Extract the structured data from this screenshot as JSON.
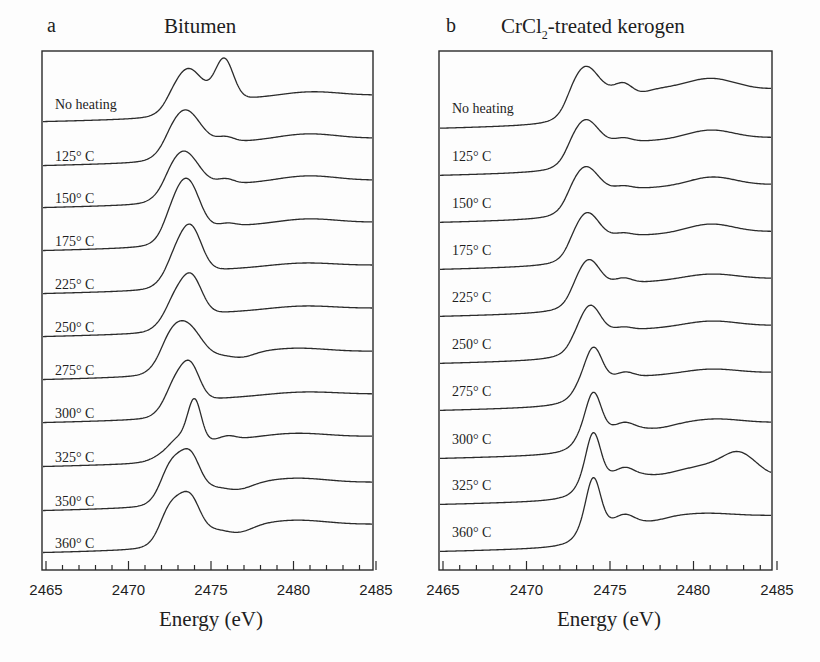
{
  "figure": {
    "panels": [
      {
        "letter": "a",
        "title": "Bitumen",
        "title_sub": "",
        "title_suffix": "",
        "frame": {
          "x0": 42,
          "y0": 51,
          "x1": 373,
          "y1": 570
        },
        "axis": {
          "px0": 46,
          "px1": 376
        }
      },
      {
        "letter": "b",
        "title": "CrCl",
        "title_sub": "2",
        "title_suffix": "-treated kerogen",
        "frame": {
          "x0": 439,
          "y0": 51,
          "x1": 772,
          "y1": 570
        },
        "axis": {
          "px0": 443,
          "px1": 777
        }
      }
    ],
    "xlabel": "Energy (eV)",
    "xticks": [
      "2465",
      "2470",
      "2475",
      "2480",
      "2485"
    ]
  },
  "chart_data": [
    {
      "type": "line",
      "title": "a  Bitumen",
      "xlabel": "Energy (eV)",
      "ylabel": "",
      "xlim": [
        2465,
        2485
      ],
      "xticks": [
        2465,
        2470,
        2475,
        2480,
        2485
      ],
      "xminor_step": 1,
      "grid": false,
      "legend": "inline labels at left of each stacked spectrum",
      "description": "Stacked sulfur K-edge XANES spectra (offset vertically), normalized absorbance vs energy",
      "series": [
        {
          "name": "No heating",
          "label_y": 106,
          "baseline_y": 122,
          "edge": 2472.3,
          "step": 20,
          "peaks": [
            {
              "e": 2473.6,
              "h": 33,
              "w": 0.85
            },
            {
              "e": 2475.8,
              "h": 40,
              "w": 0.55
            },
            {
              "e": 2481.0,
              "h": 5,
              "w": 1.8
            }
          ]
        },
        {
          "name": "125° C",
          "label_y": 158,
          "baseline_y": 166,
          "edge": 2472.2,
          "step": 21,
          "peaks": [
            {
              "e": 2473.4,
              "h": 35,
              "w": 0.9
            },
            {
              "e": 2475.9,
              "h": 5,
              "w": 0.5
            },
            {
              "e": 2480.8,
              "h": 6,
              "w": 1.8
            }
          ]
        },
        {
          "name": "150° C",
          "label_y": 200,
          "baseline_y": 208,
          "edge": 2472.2,
          "step": 21,
          "peaks": [
            {
              "e": 2473.3,
              "h": 36,
              "w": 0.9
            },
            {
              "e": 2475.9,
              "h": 5,
              "w": 0.5
            },
            {
              "e": 2480.8,
              "h": 6,
              "w": 1.8
            }
          ]
        },
        {
          "name": "175° C",
          "label_y": 243,
          "baseline_y": 251,
          "edge": 2472.1,
          "step": 22,
          "peaks": [
            {
              "e": 2473.2,
              "h": 39,
              "w": 0.75
            },
            {
              "e": 2473.9,
              "h": 18,
              "w": 0.6
            },
            {
              "e": 2476.0,
              "h": 3,
              "w": 0.5
            },
            {
              "e": 2480.8,
              "h": 5,
              "w": 1.8
            }
          ]
        },
        {
          "name": "225° C",
          "label_y": 286,
          "baseline_y": 294,
          "edge": 2472.4,
          "step": 22,
          "peaks": [
            {
              "e": 2473.2,
              "h": 28,
              "w": 0.8
            },
            {
              "e": 2473.9,
              "h": 26,
              "w": 0.6
            },
            {
              "e": 2480.5,
              "h": 4,
              "w": 2.0
            }
          ]
        },
        {
          "name": "250° C",
          "label_y": 329,
          "baseline_y": 337,
          "edge": 2472.4,
          "step": 22,
          "peaks": [
            {
              "e": 2473.0,
              "h": 24,
              "w": 0.8
            },
            {
              "e": 2473.9,
              "h": 27,
              "w": 0.6
            },
            {
              "e": 2480.5,
              "h": 4,
              "w": 2.0
            }
          ]
        },
        {
          "name": "275° C",
          "label_y": 372,
          "baseline_y": 380,
          "edge": 2472.0,
          "step": 22,
          "peaks": [
            {
              "e": 2472.8,
              "h": 30,
              "w": 0.8
            },
            {
              "e": 2473.9,
              "h": 18,
              "w": 0.7
            },
            {
              "e": 2476.9,
              "h": -4,
              "w": 0.7
            },
            {
              "e": 2480.0,
              "h": 5,
              "w": 2.0
            }
          ]
        },
        {
          "name": "300° C",
          "label_y": 415,
          "baseline_y": 423,
          "edge": 2472.4,
          "step": 22,
          "peaks": [
            {
              "e": 2472.9,
              "h": 24,
              "w": 0.7
            },
            {
              "e": 2473.8,
              "h": 28,
              "w": 0.55
            },
            {
              "e": 2480.5,
              "h": 4,
              "w": 2.2
            }
          ]
        },
        {
          "name": "325° C",
          "label_y": 459,
          "baseline_y": 467,
          "edge": 2472.6,
          "step": 24,
          "peaks": [
            {
              "e": 2472.8,
              "h": 10,
              "w": 0.9
            },
            {
              "e": 2474.0,
              "h": 40,
              "w": 0.4
            },
            {
              "e": 2476.0,
              "h": 4,
              "w": 0.5
            },
            {
              "e": 2480.0,
              "h": 5,
              "w": 2.0
            }
          ]
        },
        {
          "name": "350° C",
          "label_y": 503,
          "baseline_y": 511,
          "edge": 2472.0,
          "step": 22,
          "peaks": [
            {
              "e": 2472.7,
              "h": 30,
              "w": 0.7
            },
            {
              "e": 2473.8,
              "h": 28,
              "w": 0.55
            },
            {
              "e": 2476.7,
              "h": -5,
              "w": 0.8
            },
            {
              "e": 2480.0,
              "h": 6,
              "w": 2.0
            }
          ]
        },
        {
          "name": "360° C",
          "label_y": 545,
          "baseline_y": 553,
          "edge": 2471.9,
          "step": 22,
          "peaks": [
            {
              "e": 2472.7,
              "h": 30,
              "w": 0.7
            },
            {
              "e": 2473.8,
              "h": 27,
              "w": 0.55
            },
            {
              "e": 2476.7,
              "h": -6,
              "w": 0.8
            },
            {
              "e": 2480.0,
              "h": 6,
              "w": 2.0
            }
          ]
        }
      ]
    },
    {
      "type": "line",
      "title": "b  CrCl2-treated kerogen",
      "xlabel": "Energy (eV)",
      "ylabel": "",
      "xlim": [
        2465,
        2485
      ],
      "xticks": [
        2465,
        2470,
        2475,
        2480,
        2485
      ],
      "xminor_step": 1,
      "grid": false,
      "legend": "inline labels at left of each stacked spectrum",
      "description": "Stacked sulfur K-edge XANES spectra (offset vertically), normalized absorbance vs energy",
      "series": [
        {
          "name": "No heating",
          "label_y": 110,
          "baseline_y": 129,
          "edge": 2472.4,
          "step": 37,
          "peaks": [
            {
              "e": 2473.5,
              "h": 28,
              "w": 0.75
            },
            {
              "e": 2475.8,
              "h": 8,
              "w": 0.5
            },
            {
              "e": 2476.8,
              "h": -3,
              "w": 0.6
            },
            {
              "e": 2481.0,
              "h": 9,
              "w": 1.4
            },
            {
              "e": 2484.5,
              "h": -3,
              "w": 1.5
            }
          ]
        },
        {
          "name": "125° C",
          "label_y": 158,
          "baseline_y": 176,
          "edge": 2472.4,
          "step": 32,
          "peaks": [
            {
              "e": 2473.5,
              "h": 26,
              "w": 0.75
            },
            {
              "e": 2475.8,
              "h": 4,
              "w": 0.5
            },
            {
              "e": 2481.0,
              "h": 9,
              "w": 1.4
            }
          ]
        },
        {
          "name": "150° C",
          "label_y": 205,
          "baseline_y": 223,
          "edge": 2472.4,
          "step": 32,
          "peaks": [
            {
              "e": 2473.5,
              "h": 26,
              "w": 0.75
            },
            {
              "e": 2475.8,
              "h": 3,
              "w": 0.5
            },
            {
              "e": 2481.1,
              "h": 9,
              "w": 1.4
            }
          ]
        },
        {
          "name": "175° C",
          "label_y": 252,
          "baseline_y": 270,
          "edge": 2472.5,
          "step": 32,
          "peaks": [
            {
              "e": 2473.6,
              "h": 27,
              "w": 0.7
            },
            {
              "e": 2475.8,
              "h": 3,
              "w": 0.5
            },
            {
              "e": 2481.0,
              "h": 9,
              "w": 1.4
            }
          ]
        },
        {
          "name": "225° C",
          "label_y": 299,
          "baseline_y": 317,
          "edge": 2472.6,
          "step": 32,
          "peaks": [
            {
              "e": 2473.7,
              "h": 27,
              "w": 0.65
            },
            {
              "e": 2475.8,
              "h": 5,
              "w": 0.5
            },
            {
              "e": 2481.0,
              "h": 6,
              "w": 1.6
            }
          ]
        },
        {
          "name": "250° C",
          "label_y": 346,
          "baseline_y": 364,
          "edge": 2472.6,
          "step": 32,
          "peaks": [
            {
              "e": 2473.8,
              "h": 28,
              "w": 0.6
            },
            {
              "e": 2475.8,
              "h": 3,
              "w": 0.5
            },
            {
              "e": 2481.0,
              "h": 6,
              "w": 1.6
            }
          ]
        },
        {
          "name": "275° C",
          "label_y": 393,
          "baseline_y": 411,
          "edge": 2472.8,
          "step": 32,
          "peaks": [
            {
              "e": 2474.0,
              "h": 33,
              "w": 0.5
            },
            {
              "e": 2475.9,
              "h": 5,
              "w": 0.5
            },
            {
              "e": 2481.0,
              "h": 5,
              "w": 1.6
            }
          ]
        },
        {
          "name": "300° C",
          "label_y": 441,
          "baseline_y": 459,
          "edge": 2472.9,
          "step": 30,
          "peaks": [
            {
              "e": 2474.0,
              "h": 38,
              "w": 0.45
            },
            {
              "e": 2475.9,
              "h": 5,
              "w": 0.5
            },
            {
              "e": 2477.8,
              "h": -3,
              "w": 0.9
            },
            {
              "e": 2481.2,
              "h": 5,
              "w": 1.6
            }
          ]
        },
        {
          "name": "325° C",
          "label_y": 487,
          "baseline_y": 505,
          "edge": 2473.0,
          "step": 30,
          "peaks": [
            {
              "e": 2474.0,
              "h": 44,
              "w": 0.42
            },
            {
              "e": 2475.9,
              "h": 6,
              "w": 0.5
            },
            {
              "e": 2477.8,
              "h": -3,
              "w": 0.9
            },
            {
              "e": 2482.7,
              "h": 16,
              "w": 0.9
            },
            {
              "e": 2481.0,
              "h": 5,
              "w": 1.2
            },
            {
              "e": 2485.0,
              "h": -6,
              "w": 0.8
            }
          ]
        },
        {
          "name": "360° C",
          "label_y": 534,
          "baseline_y": 552,
          "edge": 2473.0,
          "step": 30,
          "peaks": [
            {
              "e": 2474.0,
              "h": 46,
              "w": 0.42
            },
            {
              "e": 2475.9,
              "h": 6,
              "w": 0.5
            },
            {
              "e": 2477.5,
              "h": -3,
              "w": 0.8
            },
            {
              "e": 2480.5,
              "h": 4,
              "w": 1.8
            }
          ]
        }
      ]
    }
  ]
}
